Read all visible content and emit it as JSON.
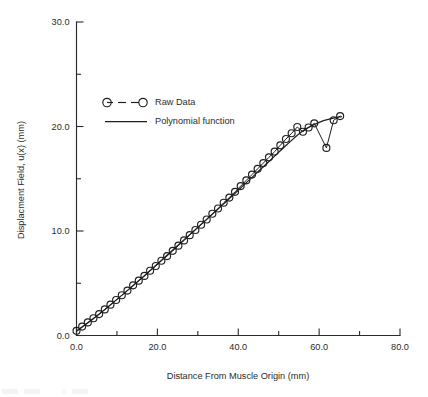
{
  "chart_data": {
    "type": "scatter",
    "title": "",
    "xlabel": "Distance From Muscle Origin (mm)",
    "ylabel": "Displacment Field, u(x) (mm)",
    "xlim": [
      0.0,
      80.0
    ],
    "ylim": [
      0.0,
      30.0
    ],
    "grid": false,
    "legend_position": "upper-center",
    "x_major_ticks": [
      "0.0",
      "20.0",
      "40.0",
      "60.0",
      "80.0"
    ],
    "x_major_values": [
      0.0,
      20.0,
      40.0,
      60.0,
      80.0
    ],
    "x_minor_values": [
      10.0,
      30.0,
      50.0,
      70.0
    ],
    "y_major_ticks": [
      "0.0",
      "10.0",
      "20.0",
      "30.0"
    ],
    "y_major_values": [
      0.0,
      10.0,
      20.0,
      30.0
    ],
    "y_minor_values": [
      5.0,
      15.0,
      25.0
    ],
    "series": [
      {
        "name": "Raw Data",
        "style": "dashed-line-with-open-circle-markers",
        "x": [
          0.0,
          1.4,
          2.8,
          4.2,
          5.6,
          7.0,
          8.4,
          9.8,
          11.2,
          12.6,
          14.0,
          15.4,
          16.8,
          18.2,
          19.6,
          21.0,
          22.4,
          23.8,
          25.2,
          26.6,
          28.0,
          29.4,
          30.8,
          32.2,
          33.6,
          35.0,
          36.4,
          37.8,
          39.2,
          40.6,
          42.0,
          43.4,
          44.8,
          46.2,
          47.6,
          49.0,
          50.4,
          51.8,
          53.2,
          54.6,
          56.0,
          57.4,
          58.8,
          61.8,
          63.6,
          65.2
        ],
        "y": [
          0.45,
          0.85,
          1.25,
          1.65,
          2.05,
          2.5,
          2.95,
          3.4,
          3.85,
          4.3,
          4.8,
          5.25,
          5.7,
          6.2,
          6.65,
          7.15,
          7.6,
          8.1,
          8.6,
          9.1,
          9.6,
          10.1,
          10.6,
          11.1,
          11.65,
          12.15,
          12.7,
          13.2,
          13.75,
          14.3,
          14.85,
          15.4,
          15.95,
          16.5,
          17.05,
          17.6,
          18.2,
          18.8,
          19.35,
          19.95,
          19.5,
          19.9,
          20.3,
          17.95,
          20.6,
          21.0
        ]
      },
      {
        "name": "Polynomial function",
        "style": "solid-line",
        "x": [
          0.0,
          4.0,
          8.0,
          12.0,
          16.0,
          20.0,
          24.0,
          28.0,
          32.0,
          36.0,
          40.0,
          44.0,
          48.0,
          52.0,
          56.0,
          60.0,
          63.0,
          65.5
        ],
        "y": [
          0.4,
          1.55,
          2.8,
          4.1,
          5.45,
          6.85,
          8.25,
          9.65,
          11.05,
          12.45,
          13.9,
          15.35,
          16.8,
          18.25,
          19.6,
          20.4,
          20.75,
          20.95
        ]
      }
    ]
  },
  "legend": {
    "items": [
      {
        "label": "Raw Data",
        "marker": "open-circle-dashed"
      },
      {
        "label": "Polynomial function",
        "marker": "solid-line"
      }
    ]
  }
}
